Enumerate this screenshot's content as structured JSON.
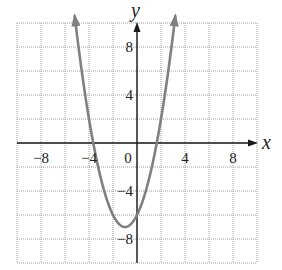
{
  "chart_data": {
    "type": "line",
    "title": "",
    "xlabel": "x",
    "ylabel": "y",
    "xlim": [
      -10,
      10
    ],
    "ylim": [
      -10,
      10
    ],
    "grid": true,
    "grid_step": 2,
    "x_ticks": [
      -8,
      -4,
      0,
      4,
      8
    ],
    "x_tick_labels": [
      "−8",
      "−4",
      "0",
      "4",
      "8"
    ],
    "y_ticks": [
      8,
      4,
      -4,
      -8
    ],
    "y_tick_labels": [
      "8",
      "4",
      "−4",
      "−8"
    ],
    "series": [
      {
        "name": "parabola",
        "equation": "y = x^2 + 2x - 6",
        "vertex": [
          -1,
          -7
        ],
        "y_intercept": -6,
        "x_intercepts": [
          -3.65,
          1.65
        ],
        "x_range": [
          -5.2,
          3.2
        ],
        "arrows_at_ends": true,
        "color": "#808080"
      }
    ],
    "legend": null
  },
  "colors": {
    "grid": "#9a9a9a",
    "axis": "#1a1a1a",
    "curve": "#808080"
  }
}
